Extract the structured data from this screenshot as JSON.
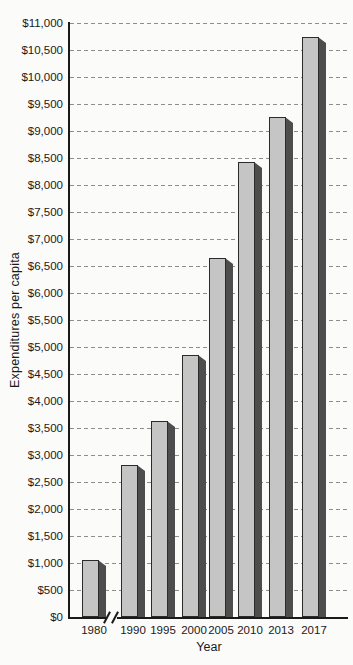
{
  "chart_data": {
    "type": "bar",
    "title": "",
    "xlabel": "Year",
    "ylabel": "Expenditures per capita",
    "categories": [
      "1980",
      "1990",
      "1995",
      "2000",
      "2005",
      "2010",
      "2013",
      "2017"
    ],
    "values": [
      1050,
      2820,
      3630,
      4860,
      6650,
      8430,
      9250,
      10740
    ],
    "ylim": [
      0,
      11000
    ],
    "y_tick_step": 500,
    "y_tick_labels": [
      "$0",
      "$500",
      "$1,000",
      "$1,500",
      "$2,000",
      "$2,500",
      "$3,000",
      "$3,500",
      "$4,000",
      "$4,500",
      "$5,000",
      "$5,500",
      "$6,000",
      "$6,500",
      "$7,000",
      "$7,500",
      "$8,000",
      "$8,500",
      "$9,000",
      "$9,500",
      "$10,000",
      "$10,500",
      "$11,000"
    ],
    "grid": "horizontal-dashed",
    "legend": "none",
    "axis_break": {
      "axis": "x",
      "between": [
        "1980",
        "1990"
      ]
    },
    "colors": {
      "bar_face": "#c5c5c5",
      "bar_side": "#4d4d4d",
      "bar_outline": "#2b2b2b",
      "gridline": "#8d8d8d",
      "axis": "#1a1a1a",
      "text": "#1a1a1a",
      "background": "#fbfbf9"
    }
  }
}
